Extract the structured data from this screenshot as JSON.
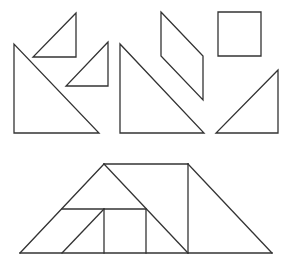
{
  "diagram": {
    "type": "tangram",
    "stroke_color": "#333333",
    "background": "#ffffff",
    "pieces": [
      {
        "name": "small-triangle-1",
        "points": [
          [
            76,
            13
          ],
          [
            33,
            57
          ],
          [
            76,
            57
          ]
        ]
      },
      {
        "name": "small-triangle-2",
        "points": [
          [
            108,
            42
          ],
          [
            66,
            86
          ],
          [
            108,
            86
          ]
        ]
      },
      {
        "name": "large-triangle-1",
        "points": [
          [
            14,
            44
          ],
          [
            14,
            133
          ],
          [
            99,
            133
          ]
        ]
      },
      {
        "name": "large-triangle-2",
        "points": [
          [
            120,
            44
          ],
          [
            120,
            133
          ],
          [
            204,
            133
          ]
        ]
      },
      {
        "name": "parallelogram",
        "points": [
          [
            161,
            12
          ],
          [
            203,
            56
          ],
          [
            203,
            100
          ],
          [
            161,
            56
          ]
        ]
      },
      {
        "name": "square",
        "points": [
          [
            218,
            12
          ],
          [
            261,
            12
          ],
          [
            261,
            56
          ],
          [
            218,
            56
          ]
        ]
      },
      {
        "name": "medium-triangle",
        "points": [
          [
            278,
            70
          ],
          [
            216,
            133
          ],
          [
            278,
            133
          ]
        ]
      }
    ],
    "assembled_figure": {
      "name": "trapezoid-assembly",
      "segments": [
        [
          [
            20,
            253
          ],
          [
            272,
            253
          ]
        ],
        [
          [
            20,
            253
          ],
          [
            104,
            164
          ]
        ],
        [
          [
            104,
            164
          ],
          [
            188,
            164
          ]
        ],
        [
          [
            188,
            164
          ],
          [
            272,
            253
          ]
        ],
        [
          [
            62,
            209
          ],
          [
            146,
            209
          ]
        ],
        [
          [
            62,
            253
          ],
          [
            104,
            209
          ]
        ],
        [
          [
            104,
            209
          ],
          [
            104,
            253
          ]
        ],
        [
          [
            146,
            209
          ],
          [
            146,
            253
          ]
        ],
        [
          [
            104,
            164
          ],
          [
            188,
            253
          ]
        ],
        [
          [
            188,
            164
          ],
          [
            188,
            253
          ]
        ]
      ]
    }
  }
}
